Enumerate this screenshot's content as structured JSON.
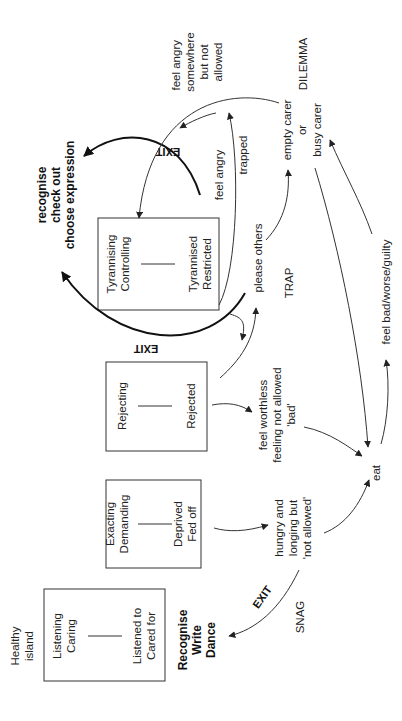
{
  "diagram": {
    "orientation": "rotated-90-ccw",
    "boxes": [
      {
        "id": "healthy",
        "top": [
          "Listening",
          "Caring"
        ],
        "bottom": [
          "Listened to",
          "Cared for"
        ]
      },
      {
        "id": "exacting",
        "top": [
          "Exacting",
          "Demanding"
        ],
        "bottom": [
          "Deprived",
          "Fed off"
        ]
      },
      {
        "id": "rejecting",
        "top": [
          "Rejecting"
        ],
        "bottom": [
          "Rejected"
        ]
      },
      {
        "id": "tyrannising",
        "top": [
          "Tyrannising",
          "Controlling"
        ],
        "bottom": [
          "Tyrannised",
          "Restricted"
        ]
      }
    ],
    "healthy_island": [
      "Healthy",
      "island"
    ],
    "recognise_write_dance": [
      "Recognise",
      "Write",
      "Dance"
    ],
    "recognise_check_out": [
      "recognise",
      "check out",
      "choose expression"
    ],
    "hungry": [
      "hungry and",
      "longing but",
      "'not allowed'"
    ],
    "feel_worthless": [
      "feel worthless",
      "feeling not allowed",
      "'bad'"
    ],
    "please_others": "please others",
    "feel_angry_trapped": [
      "feel angry",
      "trapped"
    ],
    "feel_angry_somewhere": [
      "feel angry",
      "somewhere",
      "but not",
      "allowed"
    ],
    "carer": [
      "empty carer",
      "or",
      "busy carer"
    ],
    "eat": "eat",
    "feel_bad": "feel bad/worse/guilty",
    "patterns": {
      "snag": "SNAG",
      "trap": "TRAP",
      "dilemma": "DILEMMA"
    },
    "exit_labels": [
      "EXIT",
      "EXIT",
      "EXIT"
    ]
  }
}
